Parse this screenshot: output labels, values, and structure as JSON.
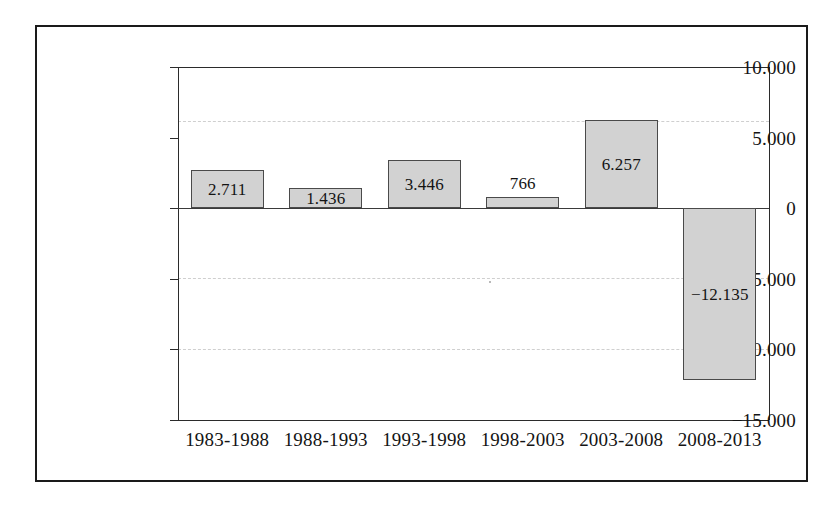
{
  "chart_data": {
    "type": "bar",
    "title": "",
    "subtitle": "",
    "xlabel": "",
    "ylabel": "",
    "categories": [
      "1983-1988",
      "1988-1993",
      "1993-1998",
      "1998-2003",
      "2003-2008",
      "2008-2013"
    ],
    "values": [
      2711,
      1436,
      3446,
      766,
      6257,
      -12135
    ],
    "value_labels": [
      "2.711",
      "1.436",
      "3.446",
      "766",
      "6.257",
      "−12.135"
    ],
    "label_placement": [
      "inside",
      "inside",
      "inside",
      "above",
      "inside",
      "inside"
    ],
    "ylim": [
      -15000,
      10000
    ],
    "yticks": [
      10000,
      5000,
      0,
      -5000,
      -10000,
      -15000
    ],
    "ytick_labels": [
      "10.000",
      "5.000",
      "0",
      "−5.000",
      "−10.000",
      "−15.000"
    ],
    "grid": true,
    "grid_axis": "y",
    "legend": false,
    "legend_position": "none",
    "decimal_separator": ".",
    "colors": {
      "bar_fill": "#d2d2d2",
      "bar_border": "#4a4a4a",
      "axis": "#2b2b2b",
      "gridline": "#cfcfcf",
      "text": "#141414",
      "frame": "#1a1a1a",
      "background": "#ffffff"
    }
  }
}
